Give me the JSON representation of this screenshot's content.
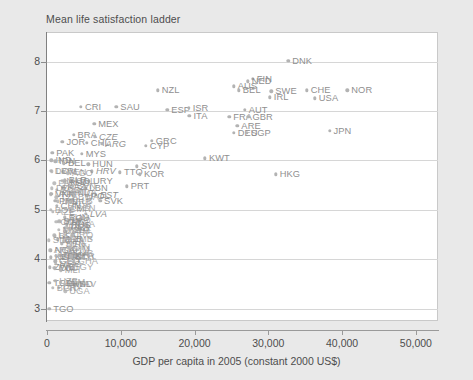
{
  "chart_data": {
    "type": "scatter",
    "title": "Mean life satisfaction ladder",
    "xlabel": "GDP per capita in 2005 (constant 2000 US$)",
    "ylabel": "Mean life satisfaction ladder",
    "xlim": [
      0,
      53000
    ],
    "ylim": [
      2.75,
      8.6
    ],
    "xticks": [
      0,
      10000,
      20000,
      30000,
      40000,
      50000
    ],
    "xtick_labels": [
      "0",
      "10,000",
      "20,000",
      "30,000",
      "40,000",
      "50,000"
    ],
    "yticks": [
      3,
      4,
      5,
      6,
      7,
      8
    ],
    "ytick_labels": [
      "3",
      "4",
      "5",
      "6",
      "7",
      "8"
    ],
    "grid": "horizontal",
    "legend": "none",
    "point_color": "#b3b3b3",
    "label_color": "#8f8f8f",
    "grid_color": "#d6d6d6",
    "plot_background": "#ffffff",
    "page_background": "#e9e9e9",
    "points": [
      {
        "label": "DNK",
        "x": 32700,
        "y": 8.02
      },
      {
        "label": "FIN",
        "x": 27900,
        "y": 7.65
      },
      {
        "label": "NED",
        "x": 27200,
        "y": 7.6
      },
      {
        "label": "NZL",
        "x": 15000,
        "y": 7.42
      },
      {
        "label": "AUS",
        "x": 25300,
        "y": 7.5
      },
      {
        "label": "BEL",
        "x": 26000,
        "y": 7.42
      },
      {
        "label": "SWE",
        "x": 30400,
        "y": 7.4
      },
      {
        "label": "CHE",
        "x": 35200,
        "y": 7.42
      },
      {
        "label": "NOR",
        "x": 40700,
        "y": 7.42
      },
      {
        "label": "IRL",
        "x": 30200,
        "y": 7.28
      },
      {
        "label": "USA",
        "x": 36300,
        "y": 7.26
      },
      {
        "label": "CRI",
        "x": 4600,
        "y": 7.08
      },
      {
        "label": "SAU",
        "x": 9400,
        "y": 7.08
      },
      {
        "label": "ESP",
        "x": 16300,
        "y": 7.02
      },
      {
        "label": "ISR",
        "x": 19200,
        "y": 7.06
      },
      {
        "label": "AUT",
        "x": 26800,
        "y": 7.02
      },
      {
        "label": "ITA",
        "x": 19300,
        "y": 6.9
      },
      {
        "label": "FRA",
        "x": 24700,
        "y": 6.88
      },
      {
        "label": "GBR",
        "x": 27300,
        "y": 6.88
      },
      {
        "label": "MEX",
        "x": 6400,
        "y": 6.74
      },
      {
        "label": "ARE",
        "x": 25800,
        "y": 6.7
      },
      {
        "label": "DEU",
        "x": 25300,
        "y": 6.56
      },
      {
        "label": "SGP",
        "x": 27100,
        "y": 6.56
      },
      {
        "label": "JPN",
        "x": 38300,
        "y": 6.6
      },
      {
        "label": "BRA",
        "x": 3600,
        "y": 6.52
      },
      {
        "label": "CZE",
        "x": 6500,
        "y": 6.48
      },
      {
        "label": "GRC",
        "x": 14200,
        "y": 6.4
      },
      {
        "label": "JOR",
        "x": 2100,
        "y": 6.38
      },
      {
        "label": "CHL",
        "x": 5400,
        "y": 6.36
      },
      {
        "label": "ARG",
        "x": 7400,
        "y": 6.34
      },
      {
        "label": "CYP",
        "x": 13400,
        "y": 6.3
      },
      {
        "label": "PAK",
        "x": 700,
        "y": 6.16
      },
      {
        "label": "MYS",
        "x": 4700,
        "y": 6.14
      },
      {
        "label": "KWT",
        "x": 21400,
        "y": 6.04
      },
      {
        "label": "IND",
        "x": 600,
        "y": 6.0
      },
      {
        "label": "IDN",
        "x": 1100,
        "y": 5.98
      },
      {
        "label": "BEL2",
        "x": 2300,
        "y": 5.94
      },
      {
        "label": "HUN",
        "x": 5600,
        "y": 5.92
      },
      {
        "label": "SVN",
        "x": 12200,
        "y": 5.88
      },
      {
        "label": "TTO",
        "x": 9900,
        "y": 5.76
      },
      {
        "label": "HRV",
        "x": 6100,
        "y": 5.78
      },
      {
        "label": "KOR",
        "x": 12600,
        "y": 5.72
      },
      {
        "label": "HKG",
        "x": 31000,
        "y": 5.72
      },
      {
        "label": "BLR",
        "x": 2400,
        "y": 5.6
      },
      {
        "label": "URY",
        "x": 5700,
        "y": 5.58
      },
      {
        "label": "KAZ",
        "x": 2200,
        "y": 5.46
      },
      {
        "label": "LBN",
        "x": 5200,
        "y": 5.44
      },
      {
        "label": "PRT",
        "x": 10800,
        "y": 5.48
      },
      {
        "label": "VNM",
        "x": 600,
        "y": 5.32
      },
      {
        "label": "EST",
        "x": 6600,
        "y": 5.3
      },
      {
        "label": "POL",
        "x": 5400,
        "y": 5.28
      },
      {
        "label": "SVK",
        "x": 7200,
        "y": 5.18
      },
      {
        "label": "PHL",
        "x": 1100,
        "y": 5.18
      },
      {
        "label": "CHN",
        "x": 1300,
        "y": 5.08
      },
      {
        "label": "LVA",
        "x": 5300,
        "y": 4.92
      },
      {
        "label": "ROU",
        "x": 2400,
        "y": 4.84
      },
      {
        "label": "RUS",
        "x": 2700,
        "y": 4.7
      },
      {
        "label": "MAR",
        "x": 1500,
        "y": 4.4
      },
      {
        "label": "NGA",
        "x": 500,
        "y": 4.18
      },
      {
        "label": "KEN",
        "x": 500,
        "y": 4.04
      },
      {
        "label": "GEO",
        "x": 1100,
        "y": 3.96
      },
      {
        "label": "ZWE",
        "x": 400,
        "y": 3.84
      },
      {
        "label": "TCD",
        "x": 300,
        "y": 3.52
      },
      {
        "label": "TGO",
        "x": 300,
        "y": 3.0
      }
    ],
    "dense_cluster_note": "Large number of overlapping low-GDP country labels near the left axis between y=3 and y=6"
  },
  "axis": {
    "y_label_top": "8",
    "x_label_text": "GDP per capita in 2005 (constant 2000 US$)"
  }
}
